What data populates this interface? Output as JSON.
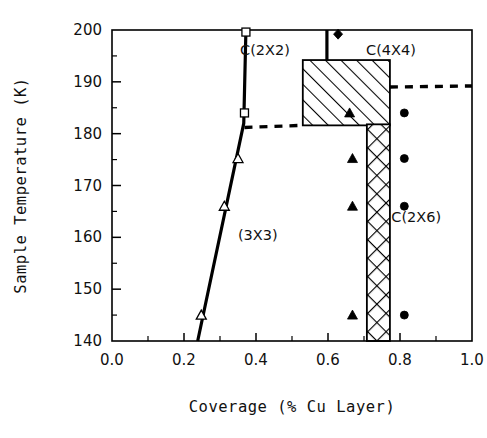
{
  "chart_data": {
    "type": "scatter",
    "title": "",
    "xlabel": "Coverage (% Cu Layer)",
    "ylabel": "Sample Temperature (K)",
    "xlim": [
      0.0,
      1.0
    ],
    "ylim": [
      140,
      200
    ],
    "grid": false,
    "legend": null,
    "x_ticks": [
      "0.0",
      "0.2",
      "0.4",
      "0.6",
      "0.8",
      "1.0"
    ],
    "x_tick_values": [
      0.0,
      0.2,
      0.4,
      0.6,
      0.8,
      1.0
    ],
    "x_minor_ticks": [
      0.1,
      0.3,
      0.5,
      0.7,
      0.9
    ],
    "y_ticks": [
      "140",
      "150",
      "160",
      "170",
      "180",
      "190",
      "200"
    ],
    "y_tick_values": [
      140,
      150,
      160,
      170,
      180,
      190,
      200
    ],
    "y_minor_ticks": [
      145,
      155,
      165,
      175,
      185,
      195
    ],
    "annotations": [
      {
        "text": "C(2X2)",
        "x": 0.425,
        "y": 196.2
      },
      {
        "text": "C(4X4)",
        "x": 0.775,
        "y": 196.2
      },
      {
        "text": "(3X3)",
        "x": 0.405,
        "y": 160.5
      },
      {
        "text": "C(2X6)",
        "x": 0.845,
        "y": 164.0
      }
    ],
    "series": [
      {
        "name": "open-square",
        "marker": "square-open",
        "points": [
          {
            "x": 0.372,
            "y": 199.6
          },
          {
            "x": 0.368,
            "y": 184.0
          }
        ]
      },
      {
        "name": "open-triangle",
        "marker": "triangle-open",
        "points": [
          {
            "x": 0.35,
            "y": 175.2
          },
          {
            "x": 0.312,
            "y": 166.0
          },
          {
            "x": 0.248,
            "y": 145.0
          }
        ]
      },
      {
        "name": "filled-triangle",
        "marker": "triangle-filled",
        "points": [
          {
            "x": 0.668,
            "y": 175.2
          },
          {
            "x": 0.668,
            "y": 166.0
          },
          {
            "x": 0.668,
            "y": 145.0
          },
          {
            "x": 0.66,
            "y": 184.0
          }
        ]
      },
      {
        "name": "filled-circle",
        "marker": "circle-filled",
        "points": [
          {
            "x": 0.812,
            "y": 184.0
          },
          {
            "x": 0.812,
            "y": 175.2
          },
          {
            "x": 0.812,
            "y": 166.0
          },
          {
            "x": 0.812,
            "y": 145.0
          }
        ]
      },
      {
        "name": "filled-diamond",
        "marker": "diamond-filled",
        "points": [
          {
            "x": 0.628,
            "y": 199.2
          }
        ]
      }
    ],
    "boundaries": [
      {
        "name": "left-phase-boundary-solid",
        "style": "solid",
        "points": [
          {
            "x": 0.372,
            "y": 200.0
          },
          {
            "x": 0.366,
            "y": 182.0
          },
          {
            "x": 0.238,
            "y": 140.0
          }
        ]
      },
      {
        "name": "upper-vertical-boundary-solid",
        "style": "solid",
        "points": [
          {
            "x": 0.597,
            "y": 200.0
          },
          {
            "x": 0.597,
            "y": 194.2
          }
        ]
      },
      {
        "name": "lower-left-boundary-dashed",
        "style": "dashed",
        "points": [
          {
            "x": 0.368,
            "y": 181.2
          },
          {
            "x": 0.53,
            "y": 181.6
          }
        ]
      },
      {
        "name": "upper-right-boundary-dashed",
        "style": "dashed",
        "points": [
          {
            "x": 0.772,
            "y": 189.0
          },
          {
            "x": 1.0,
            "y": 189.2
          }
        ]
      }
    ],
    "regions": [
      {
        "name": "hatched-region-c4x4",
        "fill": "diagonal-hatch",
        "x0": 0.53,
        "x1": 0.772,
        "y0": 181.6,
        "y1": 194.2
      },
      {
        "name": "crosshatched-region-c2x6",
        "fill": "cross-hatch",
        "x0": 0.708,
        "x1": 0.772,
        "y0": 140.0,
        "y1": 181.8
      }
    ]
  },
  "colors": {
    "ink": "#000000",
    "background": "#ffffff"
  }
}
